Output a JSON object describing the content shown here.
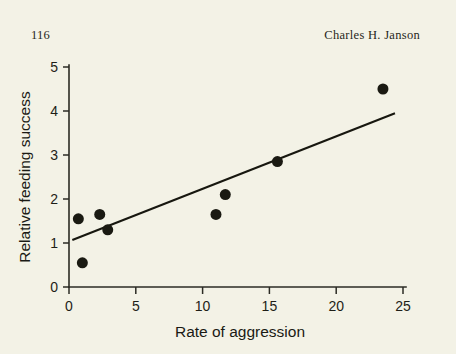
{
  "page": {
    "folio": "116",
    "running_head_author": "Charles H. Janson",
    "background_color": "#f3f2e6",
    "ink_color": "#1a1a12"
  },
  "chart_data": {
    "type": "scatter",
    "title": "",
    "xlabel": "Rate of aggression",
    "ylabel": "Relative feeding success",
    "xlim": [
      0,
      25
    ],
    "ylim": [
      0,
      5
    ],
    "xticks": [
      0,
      5,
      10,
      15,
      20,
      25
    ],
    "yticks": [
      0,
      1,
      2,
      3,
      4,
      5
    ],
    "xtick_labels": [
      "0",
      "5",
      "10",
      "15",
      "20",
      "25"
    ],
    "ytick_labels": [
      "0",
      "1",
      "2",
      "3",
      "4",
      "5"
    ],
    "grid": false,
    "legend": false,
    "marker": "filled-circle",
    "marker_size_px": 11,
    "points": [
      {
        "x": 0.7,
        "y": 1.55
      },
      {
        "x": 1.0,
        "y": 0.55
      },
      {
        "x": 2.3,
        "y": 1.65
      },
      {
        "x": 2.9,
        "y": 1.3
      },
      {
        "x": 11.0,
        "y": 1.65
      },
      {
        "x": 11.7,
        "y": 2.1
      },
      {
        "x": 15.6,
        "y": 2.85
      },
      {
        "x": 23.5,
        "y": 4.5
      }
    ],
    "series": [
      {
        "name": "observations",
        "x": [
          0.7,
          1.0,
          2.3,
          2.9,
          11.0,
          11.7,
          15.6,
          23.5
        ],
        "values": [
          1.55,
          0.55,
          1.65,
          1.3,
          1.65,
          2.1,
          2.85,
          4.5
        ]
      }
    ],
    "fit_line": {
      "type": "linear-regression",
      "x_start": 0.25,
      "y_start": 1.07,
      "x_end": 24.4,
      "y_end": 3.95
    }
  }
}
